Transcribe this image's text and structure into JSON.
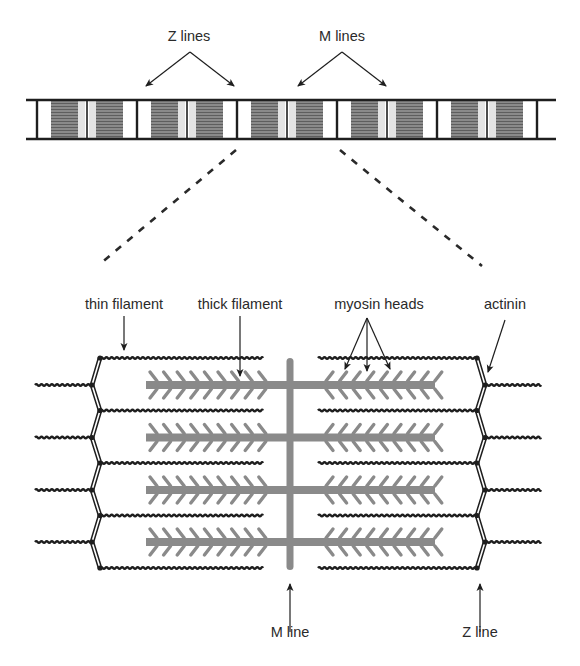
{
  "diagram": {
    "colors": {
      "line": "#1e1e1e",
      "thick_filament": "#8a8a8a",
      "dark_band": "#7c7c7c",
      "light_zone": "#e4e4e4",
      "background": "#ffffff"
    },
    "top_strip": {
      "labels": {
        "z_lines": "Z lines",
        "m_lines": "M lines"
      },
      "sarcomere_count": 5,
      "z_line_x": [
        37,
        137,
        237,
        337,
        437,
        537
      ],
      "strip_top_y": 100,
      "strip_bottom_y": 139
    },
    "zoom_lines": {
      "left": {
        "from": [
          236,
          150
        ],
        "to": [
          100,
          264
        ]
      },
      "right": {
        "from": [
          340,
          150
        ],
        "to": [
          482,
          266
        ]
      }
    },
    "detail": {
      "labels": {
        "thin_filament": "thin filament",
        "thick_filament": "thick filament",
        "myosin_heads": "myosin heads",
        "actinin": "actinin",
        "m_line": "M line",
        "z_line": "Z line"
      },
      "thin_filament_rows_y": [
        358,
        410.5,
        463,
        515.5,
        568
      ],
      "thick_filament_rows_y": [
        385,
        437.5,
        490,
        542
      ],
      "m_line_x": 290,
      "left_z_x": {
        "inner": 100,
        "outer": 92
      },
      "right_z_x": {
        "inner": 477,
        "outer": 485
      },
      "heads_per_side": 9
    }
  }
}
